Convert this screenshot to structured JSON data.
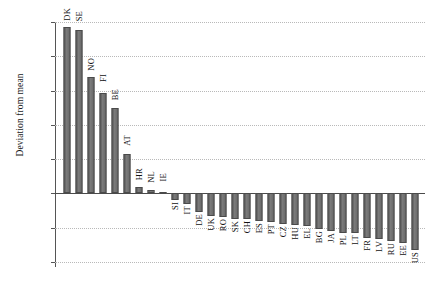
{
  "chart_data": {
    "type": "bar",
    "title": "",
    "xlabel": "",
    "ylabel": "Deviation from mean",
    "ylim": [
      -1.0,
      2.5
    ],
    "grid": "horizontal-dotted",
    "legend": "none",
    "orientation": "vertical",
    "bar_color": "#6d6d6d",
    "bar_edge_color": "#4a4a4a",
    "ytick_labels": [
      "2.50",
      "2.00",
      "1.50",
      "1.00",
      "0.50",
      "0.00",
      "-0.50",
      "-1.00"
    ],
    "ytick_values": [
      2.5,
      2.0,
      1.5,
      1.0,
      0.5,
      0.0,
      -0.5,
      -1.0
    ],
    "categories": [
      "DK",
      "SE",
      "NO",
      "FI",
      "BE",
      "AT",
      "HR",
      "NL",
      "IE",
      "SI",
      "IT",
      "DE",
      "UK",
      "RO",
      "SK",
      "CH",
      "ES",
      "PT",
      "CZ",
      "HU",
      "EL",
      "BG",
      "JA",
      "PL",
      "LT",
      "FR",
      "LV",
      "RU",
      "EE",
      "US"
    ],
    "values": [
      2.43,
      2.39,
      1.7,
      1.47,
      1.25,
      0.57,
      0.1,
      0.05,
      0.02,
      -0.1,
      -0.16,
      -0.27,
      -0.33,
      -0.35,
      -0.37,
      -0.38,
      -0.4,
      -0.42,
      -0.44,
      -0.46,
      -0.48,
      -0.52,
      -0.55,
      -0.57,
      -0.58,
      -0.65,
      -0.67,
      -0.7,
      -0.73,
      -0.83
    ]
  }
}
